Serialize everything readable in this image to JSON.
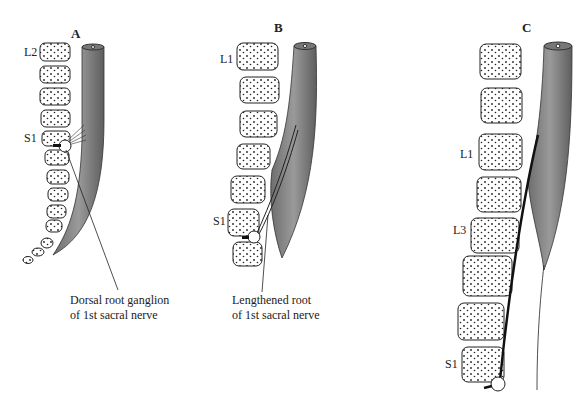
{
  "panels": [
    {
      "id": "A",
      "label": "A",
      "vertebra_labels": [
        "L2",
        "S1"
      ],
      "caption": [
        "Dorsal root ganglion",
        "of 1st sacral nerve"
      ]
    },
    {
      "id": "B",
      "label": "B",
      "vertebra_labels": [
        "L1",
        "S1"
      ],
      "caption": [
        "Lengthened root",
        "of 1st sacral nerve"
      ]
    },
    {
      "id": "C",
      "label": "C",
      "vertebra_labels": [
        "L1",
        "L3",
        "S1"
      ],
      "caption": []
    }
  ],
  "colors": {
    "cord": "#8a8a8a",
    "cord_dark": "#555555",
    "outline": "#222222"
  }
}
